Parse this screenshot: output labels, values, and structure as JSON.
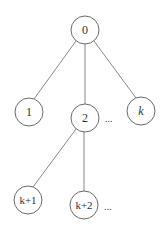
{
  "diagram": {
    "type": "tree",
    "nodes": [
      {
        "id": "n0",
        "label": "0",
        "cx": 85,
        "cy": 30,
        "r": 14,
        "italic": false
      },
      {
        "id": "n1",
        "label": "1",
        "cx": 29,
        "cy": 112,
        "r": 14,
        "italic": false
      },
      {
        "id": "n2",
        "label": "2",
        "cx": 85,
        "cy": 118,
        "r": 14,
        "italic": false
      },
      {
        "id": "nk",
        "label": "k",
        "cx": 141,
        "cy": 111,
        "r": 14,
        "italic": true
      },
      {
        "id": "nk1",
        "label": "k+1",
        "cx": 28,
        "cy": 200,
        "r": 14,
        "italic": false
      },
      {
        "id": "nk2",
        "label": "k+2",
        "cx": 84,
        "cy": 205,
        "r": 14,
        "italic": false
      }
    ],
    "edges": [
      {
        "from": "n0",
        "to": "n1"
      },
      {
        "from": "n0",
        "to": "n2"
      },
      {
        "from": "n0",
        "to": "nk"
      },
      {
        "from": "n2",
        "to": "nk1"
      },
      {
        "from": "n2",
        "to": "nk2"
      }
    ],
    "ellipses": [
      {
        "text": "...",
        "x": 105,
        "y": 122
      },
      {
        "text": "...",
        "x": 104,
        "y": 210
      }
    ]
  }
}
